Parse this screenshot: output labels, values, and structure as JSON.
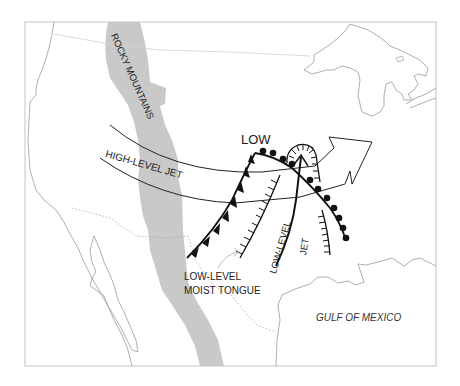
{
  "figure": {
    "type": "weather-map",
    "labels": {
      "low_center": "LOW",
      "mountains": "ROCKY MOUNTAINS",
      "high_level_jet": "HIGH-LEVEL JET",
      "moist_tongue_line1": "LOW-LEVEL",
      "moist_tongue_line2": "MOIST TONGUE",
      "low_level_jet_line1": "LOW-LEVEL",
      "low_level_jet_line2": "JET",
      "gulf": "GULF OF MEXICO"
    },
    "colors": {
      "background": "#ffffff",
      "mountains_fill": "#c8c8c8",
      "coastline": "#9a9a9a",
      "border_dotted": "#aaaaaa",
      "frame": "#bdbdbd",
      "fronts": "#111111",
      "jet_outline": "#222222"
    },
    "features": [
      {
        "name": "cold-front",
        "symbol": "triangles"
      },
      {
        "name": "warm-front",
        "symbol": "semicircles"
      },
      {
        "name": "dry-line-trough",
        "symbol": "hatched"
      },
      {
        "name": "high-level-jet",
        "symbol": "open-arrow"
      },
      {
        "name": "low-level-jet",
        "symbol": "solid-arrow"
      },
      {
        "name": "moist-tongue-flow",
        "symbol": "thin-arrow"
      }
    ]
  }
}
